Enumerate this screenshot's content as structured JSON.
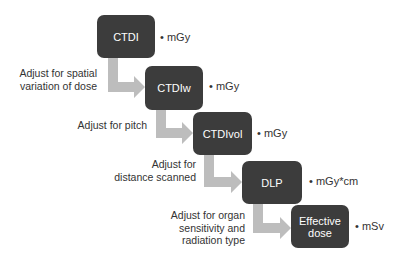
{
  "diagram": {
    "colors": {
      "box": "#3c3c3c",
      "arrow": "#bdbdbd",
      "text": "#333333"
    },
    "steps": [
      {
        "label": "CTDI",
        "unit": "• mGy"
      },
      {
        "label": "CTDIw",
        "unit": "• mGy"
      },
      {
        "label": "CTDIvol",
        "unit": "• mGy"
      },
      {
        "label": "DLP",
        "unit": "• mGy*cm"
      },
      {
        "label": "Effective dose",
        "unit": "• mSv"
      }
    ],
    "transitions": [
      {
        "line1": "Adjust for spatial",
        "line2": "variation of dose",
        "line3": ""
      },
      {
        "line1": "Adjust for pitch",
        "line2": "",
        "line3": ""
      },
      {
        "line1": "Adjust for",
        "line2": "distance scanned",
        "line3": ""
      },
      {
        "line1": "Adjust for organ",
        "line2": "sensitivity and",
        "line3": "radiation type"
      }
    ]
  }
}
